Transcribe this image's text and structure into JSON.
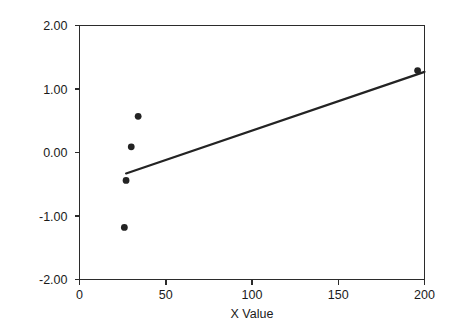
{
  "chart_data": {
    "type": "scatter",
    "title": "",
    "subtitle": "",
    "xlabel": "X Value",
    "ylabel": "",
    "xlim": [
      0,
      200
    ],
    "ylim": [
      -2.0,
      2.0
    ],
    "x_ticks": [
      0,
      50,
      100,
      150,
      200
    ],
    "x_tick_labels": [
      "0",
      "50",
      "100",
      "150",
      "200"
    ],
    "y_ticks": [
      2.0,
      1.0,
      0.0,
      -1.0,
      -2.0
    ],
    "y_tick_labels": [
      "2.00",
      "1.00",
      "0.00",
      "-1.00",
      "-2.00"
    ],
    "grid": false,
    "legend": null,
    "legend_position": "none",
    "series": [
      {
        "name": "Observed",
        "type": "scatter",
        "marker": "circle",
        "color": "#232323",
        "points": [
          {
            "x": 26,
            "y": -1.18
          },
          {
            "x": 27,
            "y": -0.44
          },
          {
            "x": 30,
            "y": 0.09
          },
          {
            "x": 34,
            "y": 0.57
          },
          {
            "x": 196,
            "y": 1.29
          }
        ]
      },
      {
        "name": "Fit line",
        "type": "line",
        "color": "#232323",
        "points": [
          {
            "x": 27,
            "y": -0.33
          },
          {
            "x": 200,
            "y": 1.27
          }
        ]
      }
    ]
  },
  "axes": {
    "x_axis_label": "X Value",
    "y_axis_label": ""
  }
}
